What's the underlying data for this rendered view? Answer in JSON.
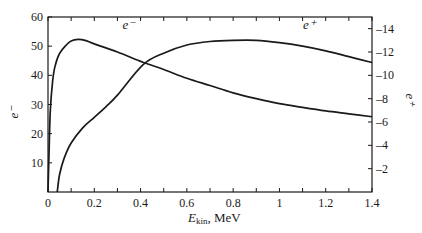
{
  "chart_data": {
    "type": "line",
    "title": "",
    "xlabel": "E_kin, MeV",
    "xlabel_main": "E",
    "xlabel_sub": "kin",
    "xlabel_unit": ", MeV",
    "ylabel_left": "e⁻",
    "ylabel_right": "e⁺",
    "xlim": [
      0,
      1.4
    ],
    "ylim_left": [
      0,
      60
    ],
    "ylim_right": [
      0,
      15
    ],
    "x_ticks": [
      0,
      0.2,
      0.4,
      0.6,
      0.8,
      1,
      1.2,
      1.4
    ],
    "x_tick_labels": [
      "0",
      "0.2",
      "0.4",
      "0.6",
      "0.8",
      "1",
      "1.2",
      "1.4"
    ],
    "y_left_ticks": [
      10,
      20,
      30,
      40,
      50,
      60
    ],
    "y_left_tick_labels": [
      "10",
      "20",
      "30",
      "40",
      "50",
      "60"
    ],
    "y_right_ticks": [
      2,
      4,
      6,
      8,
      10,
      12,
      14
    ],
    "y_right_tick_labels": [
      "–2",
      "–4",
      "–6",
      "–8",
      "–10",
      "–12",
      "–14"
    ],
    "grid": false,
    "legend": "inline labels",
    "series": [
      {
        "name": "e⁻",
        "axis": "left",
        "label_pos": [
          0.35,
          56
        ],
        "x": [
          0,
          0.005,
          0.01,
          0.02,
          0.03,
          0.05,
          0.08,
          0.1,
          0.13,
          0.16,
          0.2,
          0.3,
          0.41,
          0.5,
          0.6,
          0.7,
          0.8,
          0.9,
          1.0,
          1.1,
          1.2,
          1.3,
          1.4
        ],
        "values": [
          0,
          15,
          28,
          38,
          43,
          47.5,
          50.5,
          51.8,
          52.3,
          52,
          50.8,
          48,
          44.5,
          42,
          39,
          36.5,
          34,
          32,
          30.3,
          29,
          27.8,
          26.8,
          25.8
        ]
      },
      {
        "name": "e⁺",
        "axis": "right",
        "label_pos": [
          1.13,
          14
        ],
        "x": [
          0.04,
          0.05,
          0.07,
          0.1,
          0.15,
          0.2,
          0.25,
          0.3,
          0.41,
          0.5,
          0.6,
          0.7,
          0.8,
          0.9,
          1.0,
          1.1,
          1.2,
          1.3,
          1.4
        ],
        "values": [
          0,
          1.5,
          2.9,
          4.2,
          5.5,
          6.4,
          7.3,
          8.3,
          10.9,
          11.9,
          12.6,
          12.9,
          13.0,
          13.0,
          12.8,
          12.5,
          12.1,
          11.6,
          11.1
        ]
      }
    ]
  }
}
